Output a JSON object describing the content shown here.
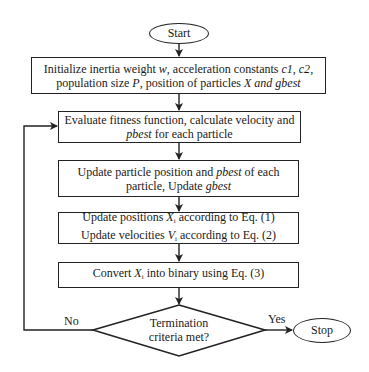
{
  "diagram": {
    "type": "flowchart",
    "nodes": {
      "start": {
        "label": "Start",
        "shape": "ellipse"
      },
      "init": {
        "shape": "rectangle",
        "line1_pre": "Initialize inertia weight ",
        "line1_w": "w",
        "line1_mid": ", acceleration constants ",
        "line1_c1": "c1",
        "line1_sep": ", ",
        "line1_c2": "c2",
        "line1_end": ",",
        "line2_pre": "population size ",
        "line2_P": "P",
        "line2_mid": ", position of particles ",
        "line2_X": "X and gbest"
      },
      "evaluate": {
        "shape": "rectangle",
        "line1": "Evaluate fitness function, calculate velocity and",
        "line2_italic": "pbest",
        "line2_rest": " for each particle"
      },
      "update_particle": {
        "shape": "rectangle",
        "line1_pre": "Update particle position and ",
        "line1_italic": "pbest",
        "line1_rest": " of each",
        "line2_pre": "particle, Update ",
        "line2_italic": "gbest"
      },
      "update_pos_vel": {
        "shape": "rectangle",
        "line1_pre": "Update positions ",
        "line1_var": "X",
        "line1_sub": "i",
        "line1_rest": " according to Eq. (1)",
        "line2_pre": "Update velocities ",
        "line2_var": "V",
        "line2_sub": "i",
        "line2_rest": " according to Eq. (2)"
      },
      "convert": {
        "shape": "rectangle",
        "pre": "Convert ",
        "var": "X",
        "sub": "i",
        "rest": " into binary using Eq. (3)"
      },
      "decision": {
        "shape": "diamond",
        "line1": "Termination",
        "line2": "criteria met?"
      },
      "stop": {
        "label": "Stop",
        "shape": "ellipse"
      }
    },
    "edges": {
      "no_label": "No",
      "yes_label": "Yes"
    },
    "colors": {
      "stroke": "#222222",
      "fill": "#ffffff",
      "text": "#1a1a1a"
    }
  }
}
